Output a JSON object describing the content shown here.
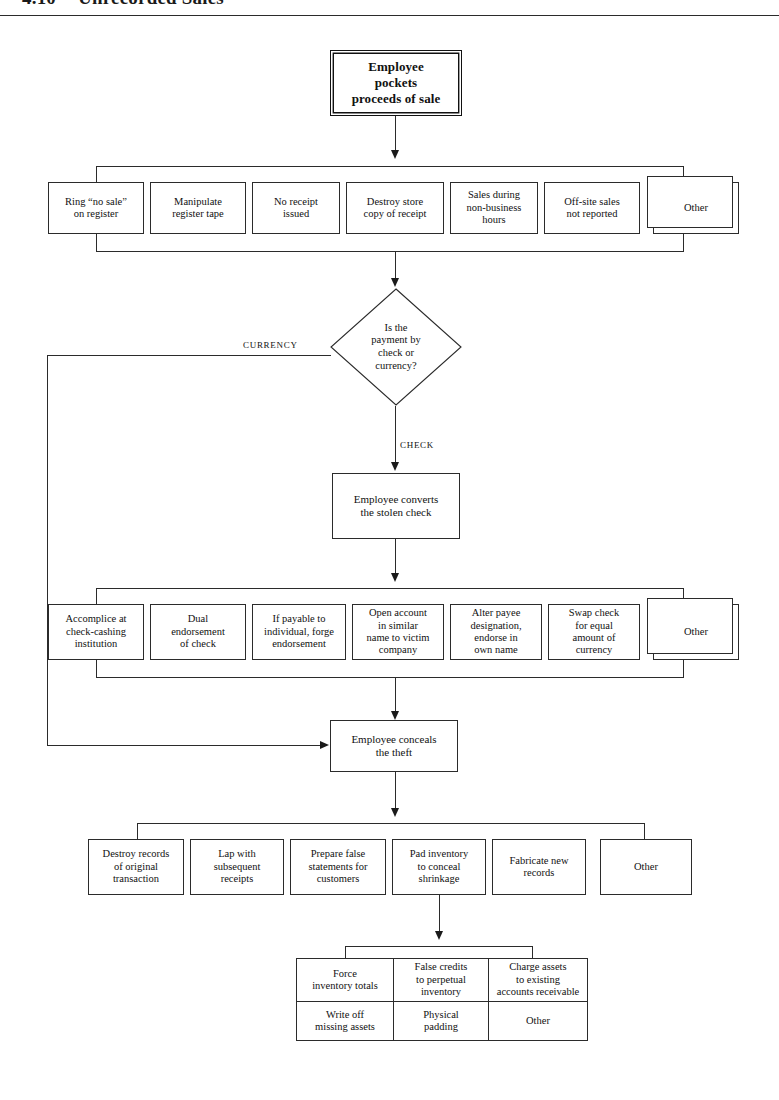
{
  "page": {
    "running_head_number": "4.10",
    "running_head_title": "Unrecorded Sales"
  },
  "start_node": {
    "label": "Employee\npockets\nproceeds of sale"
  },
  "row1": {
    "caption": "Methods of making sales unrecorded",
    "boxes": [
      "Ring “no sale”\non register",
      "Manipulate\nregister tape",
      "No receipt\nissued",
      "Destroy store\ncopy of receipt",
      "Sales during\nnon-business\nhours",
      "Off-site sales\nnot reported",
      "Other"
    ]
  },
  "decision": {
    "label": "Is the\npayment by\ncheck or\ncurrency?",
    "branch_left": "CURRENCY",
    "branch_down": "CHECK"
  },
  "convert_node": {
    "label": "Employee converts\nthe stolen check"
  },
  "row2": {
    "caption": "Methods of converting the stolen check",
    "boxes": [
      "Accomplice at\ncheck-cashing\ninstitution",
      "Dual\nendorsement\nof check",
      "If payable to\nindividual, forge\nendorsement",
      "Open account\nin similar\nname to victim\ncompany",
      "Alter payee\ndesignation,\nendorse in\nown name",
      "Swap check\nfor equal\namount of\ncurrency",
      "Other"
    ]
  },
  "conceal_node": {
    "label": "Employee conceals\nthe theft"
  },
  "row3": {
    "caption": "Methods of concealing the theft",
    "boxes": [
      "Destroy records\nof original\ntransaction",
      "Lap with\nsubsequent\nreceipts",
      "Prepare false\nstatements for\ncustomers",
      "Pad inventory\nto conceal\nshrinkage",
      "Fabricate new\nrecords",
      "Other"
    ]
  },
  "row4": {
    "caption": "Methods of padding inventory",
    "cells": [
      "Force\ninventory totals",
      "False credits\nto perpetual\ninventory",
      "Charge assets\nto existing\naccounts receivable",
      "Write off\nmissing assets",
      "Physical\npadding",
      "Other"
    ]
  },
  "colors": {
    "ink": "#2b2b2b",
    "paper": "#ffffff",
    "arrow": "#1a1a1a"
  }
}
